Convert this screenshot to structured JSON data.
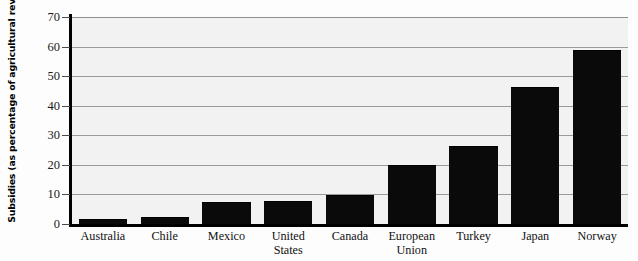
{
  "chart_data": {
    "type": "bar",
    "title": "",
    "xlabel": "",
    "ylabel": "Subsidies (as percentage of agricultural revenue)",
    "ylim": [
      0,
      70
    ],
    "yticks": [
      0,
      10,
      20,
      30,
      40,
      50,
      60,
      70
    ],
    "grid": true,
    "legend": "none",
    "bar_color": "#0a0a0a",
    "plot_background": "#f2f2f2",
    "gridline_color": "#9a9a9a",
    "categories": [
      "Australia",
      "Chile",
      "Mexico",
      "United States",
      "Canada",
      "European Union",
      "Turkey",
      "Japan",
      "Norway"
    ],
    "category_lines": [
      [
        "Australia"
      ],
      [
        "Chile"
      ],
      [
        "Mexico"
      ],
      [
        "United",
        "States"
      ],
      [
        "Canada"
      ],
      [
        "European",
        "Union"
      ],
      [
        "Turkey"
      ],
      [
        "Japan"
      ],
      [
        "Norway"
      ]
    ],
    "values": [
      1.5,
      2.2,
      7.0,
      7.5,
      9.5,
      19.5,
      26.0,
      46.0,
      58.5
    ]
  }
}
